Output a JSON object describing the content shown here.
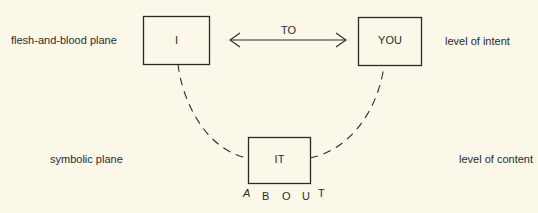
{
  "diagram": {
    "nodes": {
      "i": {
        "label": "I"
      },
      "you": {
        "label": "YOU"
      },
      "it": {
        "label": "IT"
      }
    },
    "edges": {
      "to": {
        "label": "TO",
        "from": "I",
        "to": "YOU",
        "style": "double-arrow"
      },
      "about": {
        "label": "ABOUT",
        "letters": [
          "A",
          "B",
          "O",
          "U",
          "T"
        ],
        "style": "dashed-arc",
        "path": "I - IT - YOU"
      }
    },
    "labels": {
      "top_left": "flesh-and-blood plane",
      "top_right": "level of intent",
      "bottom_left": "symbolic plane",
      "bottom_right": "level of content"
    },
    "colors": {
      "background": "#fbf8ea",
      "ink": "#2a2a2a"
    }
  }
}
